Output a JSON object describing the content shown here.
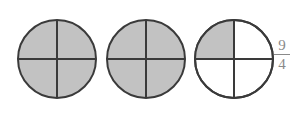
{
  "figure": {
    "fill_color": "#c2c2c2",
    "stroke_color": "#3a3a3a",
    "circles": [
      {
        "cx": 57,
        "cy": 59,
        "r": 39,
        "shaded_quarters": 4
      },
      {
        "cx": 146,
        "cy": 59,
        "r": 39,
        "shaded_quarters": 4
      },
      {
        "cx": 234,
        "cy": 59,
        "r": 39,
        "shaded_quarters": 1
      }
    ]
  },
  "fraction": {
    "numerator": "9",
    "denominator": "4"
  }
}
